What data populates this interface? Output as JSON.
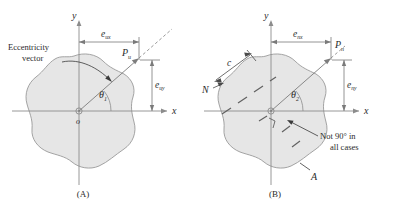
{
  "figure": {
    "background": "#ffffff",
    "blob_fill": "#e6e6e6",
    "blob_stroke": "#9a9a9a",
    "axis_color": "#8c8c8c",
    "dim_color": "#7a7a7a",
    "text_color": "#2b2b2b",
    "vector_color": "#6f6f6f"
  },
  "panels": [
    {
      "id": "A",
      "caption": "(A)",
      "axes": {
        "y_label": "y",
        "x_label": "x",
        "origin_label": "o"
      },
      "callout": {
        "line1": "Eccentricity",
        "line2": "vector"
      },
      "point_label": "P",
      "point_sub": "u",
      "angle_label": "θ",
      "angle_sub": "1",
      "dim_x": {
        "base": "e",
        "sub": "ux"
      },
      "dim_y": {
        "base": "e",
        "sub": "uy"
      }
    },
    {
      "id": "B",
      "caption": "(B)",
      "axes": {
        "y_label": "y",
        "x_label": "x"
      },
      "point_label": "P",
      "point_sub": "n",
      "angle_label": "θ",
      "angle_sub": "2",
      "dim_x": {
        "base": "e",
        "sub": "nx"
      },
      "dim_y": {
        "base": "e",
        "sub": "ny"
      },
      "neutral_axis_label": "N",
      "c_label": "c",
      "area_label": "A",
      "note": {
        "line1": "Not 90° in",
        "line2": "all cases"
      }
    }
  ]
}
